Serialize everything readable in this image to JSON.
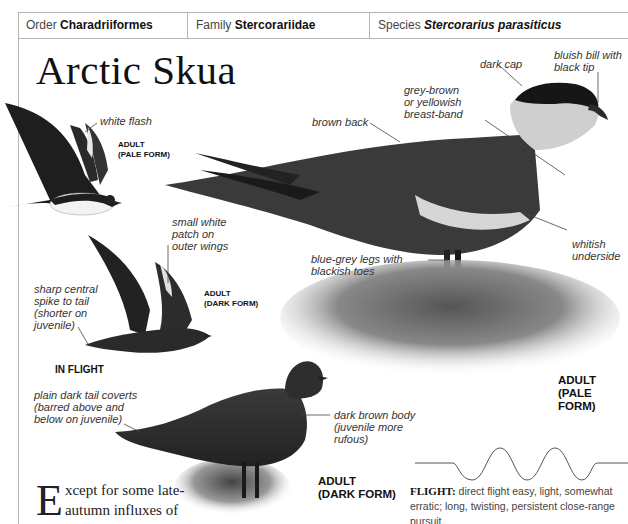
{
  "header": {
    "order_label": "Order",
    "order_value": "Charadriiformes",
    "family_label": "Family",
    "family_value": "Stercorariidae",
    "species_label": "Species",
    "species_value": "Stercorarius parasiticus"
  },
  "title": "Arctic Skua",
  "illustrations": {
    "flight_pale": {
      "form_label": "ADULT\n(PALE FORM)",
      "annotations": [
        "white flash"
      ]
    },
    "flight_dark": {
      "form_label": "ADULT\n(DARK FORM)",
      "annotations": [
        "small white\npatch on\nouter wings",
        "sharp central\nspike to tail\n(shorter on\njuvenile)"
      ]
    },
    "in_flight_label": "IN FLIGHT",
    "standing_pale": {
      "form_label": "ADULT\n(PALE FORM)",
      "annotations": [
        "dark cap",
        "bluish bill with\nblack tip",
        "grey-brown\nor yellowish\nbreast-band",
        "brown back",
        "whitish\nunderside",
        "blue-grey legs with\nblackish toes"
      ]
    },
    "standing_dark": {
      "form_label": "ADULT\n(DARK FORM)",
      "annotations": [
        "plain dark tail coverts\n(barred above and\nbelow on juvenile)",
        "dark brown body\n(juvenile more\nrufous)"
      ]
    }
  },
  "flight": {
    "label": "FLIGHT:",
    "description": "direct flight easy, light, somewhat erratic; long, twisting, persistent close-range pursuit."
  },
  "body_text": {
    "dropcap": "E",
    "text": "xcept for some late-autumn influxes of Pomarines"
  },
  "colors": {
    "rule": "#b5b5b5",
    "text": "#222222"
  }
}
